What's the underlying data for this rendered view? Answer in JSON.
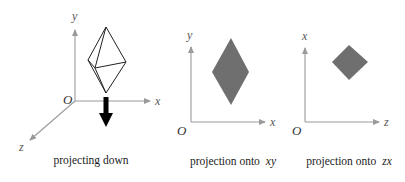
{
  "colors": {
    "axis": "#9a9a9a",
    "solid_edge": "#222222",
    "projection_fill": "#6f6f6f",
    "arrow": "#000000",
    "text": "#222222"
  },
  "panels": [
    {
      "id": "projecting-down",
      "axes": {
        "vertical": "y",
        "horizontal": "x",
        "depth": "z",
        "origin": "O"
      },
      "caption": "projecting down",
      "shape": "octahedron (3D wireframe)",
      "arrow": "down"
    },
    {
      "id": "projection-xy",
      "axes": {
        "vertical": "y",
        "horizontal": "x",
        "origin": "O"
      },
      "caption_prefix": "projection onto",
      "caption_plane": "xy",
      "shape": "tall rhombus (filled)"
    },
    {
      "id": "projection-zx",
      "axes": {
        "vertical": "x",
        "horizontal": "z",
        "origin": "O"
      },
      "caption_prefix": "projection onto",
      "caption_plane": "zx",
      "shape": "square rhombus (filled)"
    }
  ]
}
